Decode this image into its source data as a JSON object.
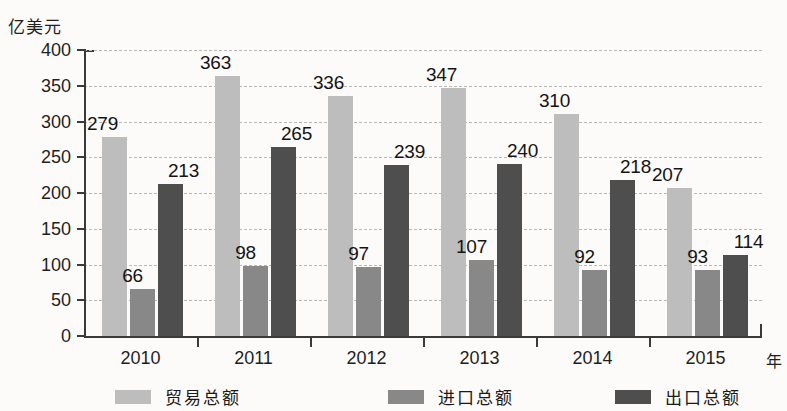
{
  "chart_data": {
    "type": "bar",
    "title": "",
    "subtitle": "",
    "xlabel": "年",
    "ylabel": "亿美元",
    "ylim": [
      0,
      400
    ],
    "ytick_step": 50,
    "yticks": [
      "0",
      "50",
      "100",
      "150",
      "200",
      "250",
      "300",
      "350",
      "400"
    ],
    "grid": true,
    "grid_style": "dashed-horizontal",
    "legend_position": "bottom",
    "categories": [
      "2010",
      "2011",
      "2012",
      "2013",
      "2014",
      "2015"
    ],
    "series": [
      {
        "name": "贸易总额",
        "color": "#bdbdbd",
        "values": [
          279,
          363,
          336,
          347,
          310,
          207
        ]
      },
      {
        "name": "进口总额",
        "color": "#888888",
        "values": [
          66,
          98,
          97,
          107,
          92,
          93
        ]
      },
      {
        "name": "出口总额",
        "color": "#4e4e4e",
        "values": [
          213,
          265,
          239,
          240,
          218,
          114
        ]
      }
    ]
  }
}
